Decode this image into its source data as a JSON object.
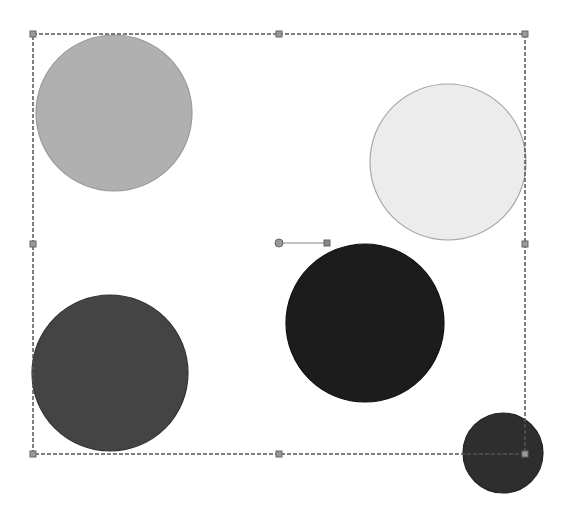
{
  "canvas": {
    "width": 567,
    "height": 518,
    "background": "#ffffff"
  },
  "selection": {
    "x": 33,
    "y": 34,
    "width": 492,
    "height": 420,
    "stroke": "#555555",
    "handles": [
      {
        "x": 33,
        "y": 34
      },
      {
        "x": 279,
        "y": 34
      },
      {
        "x": 525,
        "y": 34
      },
      {
        "x": 33,
        "y": 244
      },
      {
        "x": 525,
        "y": 244
      },
      {
        "x": 33,
        "y": 454
      },
      {
        "x": 279,
        "y": 454
      },
      {
        "x": 525,
        "y": 454
      }
    ],
    "rotation_handle": {
      "x1": 279,
      "y1": 243,
      "x2": 327,
      "y2": 243
    }
  },
  "shapes": [
    {
      "name": "circle-light-gray",
      "cx": 114,
      "cy": 113,
      "r": 78,
      "fill": "#b0b0b0",
      "stroke": "#9a9a9a"
    },
    {
      "name": "circle-near-white",
      "cx": 448,
      "cy": 162,
      "r": 78,
      "fill": "#ececec",
      "stroke": "#a8a8a8"
    },
    {
      "name": "circle-black",
      "cx": 365,
      "cy": 323,
      "r": 79,
      "fill": "#1c1c1c",
      "stroke": "#111111"
    },
    {
      "name": "circle-dark-gray",
      "cx": 110,
      "cy": 373,
      "r": 78,
      "fill": "#444444",
      "stroke": "#333333"
    },
    {
      "name": "circle-small-dark",
      "cx": 503,
      "cy": 453,
      "r": 40,
      "fill": "#2e2e2e",
      "stroke": "#222222"
    }
  ]
}
